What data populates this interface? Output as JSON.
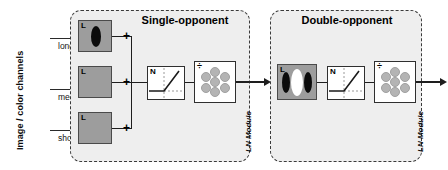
{
  "diagram": {
    "type": "flow-diagram",
    "title_visible": false,
    "input": {
      "axis_label": "Image / color channels",
      "channels": [
        {
          "name": "long",
          "icon": "arrow-right-icon"
        },
        {
          "name": "medium",
          "icon": "arrow-right-icon"
        },
        {
          "name": "short",
          "icon": "arrow-right-icon"
        }
      ]
    },
    "modules": [
      {
        "id": "single-opponent",
        "title": "Single-opponent",
        "footer_label": "LN Module",
        "receptive_fields": [
          {
            "tag": "L",
            "pattern": "single-dark-ellipse"
          },
          {
            "tag": "L",
            "pattern": "uniform-gray"
          },
          {
            "tag": "L",
            "pattern": "uniform-gray"
          }
        ],
        "summation_signs": [
          "+",
          "+",
          "+"
        ],
        "nonlinearity": {
          "tag": "N",
          "curve": "half-wave-rectifier"
        },
        "normalization": {
          "tag": "÷",
          "pattern": "hexagonal-pool-7-units",
          "unit_count": 7
        }
      },
      {
        "id": "double-opponent",
        "title": "Double-opponent",
        "footer_label": "LN Module",
        "receptive_fields": [
          {
            "tag": "L",
            "pattern": "dark-light-dark-ellipses"
          }
        ],
        "summation_signs": [],
        "nonlinearity": {
          "tag": "N",
          "curve": "half-wave-rectifier"
        },
        "normalization": {
          "tag": "÷",
          "pattern": "hexagonal-pool-7-units",
          "unit_count": 7
        }
      }
    ],
    "colors": {
      "module_fill": "#eeeeee",
      "module_border": "#3a3a3a",
      "receptive_field_fill": "#9d9d9d",
      "box_fill": "#ffffff",
      "line": "#1e1e1e",
      "pool_unit": "#b4b4b4"
    }
  }
}
